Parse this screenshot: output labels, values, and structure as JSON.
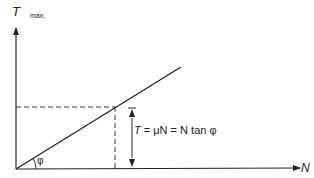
{
  "diagram": {
    "y_axis": {
      "label": "T",
      "subscript": "max."
    },
    "x_axis": {
      "label": "N"
    },
    "angle_label": "φ",
    "equation": {
      "t": "T",
      "rest": " = μN = N tan φ"
    },
    "colors": {
      "stroke": "#222222",
      "background": "#ffffff"
    }
  }
}
